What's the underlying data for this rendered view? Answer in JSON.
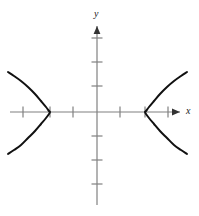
{
  "figure": {
    "background_color": "#ffffff",
    "width": 199,
    "height": 216
  },
  "axes": {
    "x": {
      "label": "x",
      "color": "#808080",
      "arrow": "right",
      "origin_px": 97,
      "line_y_px": 112,
      "start_px": 10,
      "end_px": 180,
      "tick_length_px": 11,
      "tick_positions_px": [
        23,
        50,
        73,
        120,
        145,
        168
      ]
    },
    "y": {
      "label": "y",
      "color": "#808080",
      "arrow": "up",
      "origin_px": 112,
      "line_x_px": 97,
      "start_px": 26,
      "end_px": 205,
      "tick_length_px": 11,
      "tick_positions_px": [
        38,
        62,
        86,
        136,
        160,
        184
      ]
    }
  },
  "chart_data": {
    "type": "line",
    "title": "",
    "xlabel": "x",
    "ylabel": "y",
    "grid": false,
    "legend": null,
    "curve_name": "hyperbola",
    "curve_color": "#111111",
    "curve_width_px": 2,
    "equation": "x^2/a^2 - y^2/b^2 = 1",
    "center": [
      0,
      0
    ],
    "vertices": [
      [
        -2,
        0
      ],
      [
        2,
        0
      ]
    ],
    "a_units": 2,
    "b_units": 2,
    "axis_unit_px_x": 23.5,
    "axis_unit_px_y": 24,
    "xlim": [
      -4.1,
      3.6
    ],
    "ylim": [
      -4.2,
      3.6
    ],
    "series": [
      {
        "name": "left-branch",
        "orientation": "opens-left",
        "vertex_px": [
          50,
          112
        ],
        "points_px": [
          [
            8,
            72
          ],
          [
            14,
            76
          ],
          [
            21,
            81
          ],
          [
            28,
            87
          ],
          [
            35,
            94
          ],
          [
            41,
            101
          ],
          [
            46,
            107
          ],
          [
            49,
            111
          ],
          [
            50,
            112
          ],
          [
            49,
            114
          ],
          [
            46,
            118
          ],
          [
            41,
            124
          ],
          [
            35,
            131
          ],
          [
            28,
            138
          ],
          [
            21,
            145
          ],
          [
            14,
            150
          ],
          [
            8,
            154
          ]
        ]
      },
      {
        "name": "right-branch",
        "orientation": "opens-right",
        "vertex_px": [
          145,
          112
        ],
        "points_px": [
          [
            187,
            72
          ],
          [
            181,
            76
          ],
          [
            174,
            81
          ],
          [
            167,
            87
          ],
          [
            160,
            94
          ],
          [
            154,
            101
          ],
          [
            149,
            107
          ],
          [
            146,
            111
          ],
          [
            145,
            112
          ],
          [
            146,
            114
          ],
          [
            149,
            118
          ],
          [
            154,
            124
          ],
          [
            160,
            131
          ],
          [
            167,
            138
          ],
          [
            174,
            145
          ],
          [
            181,
            150
          ],
          [
            187,
            154
          ]
        ]
      }
    ]
  }
}
